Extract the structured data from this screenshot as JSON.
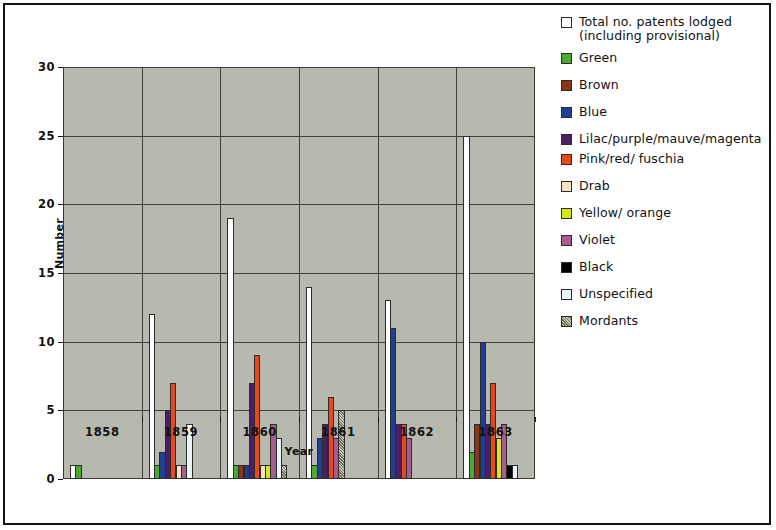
{
  "chart_data": {
    "type": "bar",
    "title": "",
    "xlabel": "Year",
    "ylabel": "Number",
    "categories": [
      "1858",
      "1859",
      "1860",
      "1861",
      "1862",
      "1863"
    ],
    "ylim": [
      0,
      30
    ],
    "yticks": [
      0,
      5,
      10,
      15,
      20,
      25,
      30
    ],
    "grid": true,
    "legend_position": "right",
    "series": [
      {
        "name": "Total no. patents lodged (including provisional)",
        "color": "#ffffff",
        "values": [
          1,
          12,
          19,
          14,
          13,
          25
        ]
      },
      {
        "name": "Green",
        "color": "#4da832",
        "values": [
          1,
          1,
          1,
          1,
          0,
          2
        ]
      },
      {
        "name": "Brown",
        "color": "#8c3415",
        "values": [
          0,
          0,
          1,
          0,
          0,
          4
        ]
      },
      {
        "name": "Blue",
        "color": "#1f3f92",
        "values": [
          0,
          2,
          1,
          3,
          11,
          10
        ]
      },
      {
        "name": "Lilac/purple/mauve/magenta",
        "color": "#4b1f63",
        "values": [
          0,
          5,
          7,
          4,
          4,
          4
        ]
      },
      {
        "name": "Pink/red/ fuschia",
        "color": "#e8491b",
        "values": [
          0,
          7,
          9,
          6,
          4,
          7
        ]
      },
      {
        "name": "Drab",
        "color": "#f7e3bd",
        "values": [
          0,
          1,
          1,
          0,
          0,
          0
        ]
      },
      {
        "name": "Yellow/ orange",
        "color": "#d6e617",
        "values": [
          0,
          0,
          1,
          0,
          0,
          3
        ]
      },
      {
        "name": "Violet",
        "color": "#a85d8e",
        "values": [
          0,
          1,
          4,
          3,
          3,
          4
        ]
      },
      {
        "name": "Black",
        "color": "#000000",
        "values": [
          0,
          0,
          0,
          0,
          0,
          1
        ]
      },
      {
        "name": "Unspecified",
        "color": "#e8f4f8",
        "values": [
          0,
          4,
          3,
          0,
          0,
          1
        ]
      },
      {
        "name": "Mordants",
        "color": "#8a8a72",
        "values": [
          0,
          0,
          1,
          5,
          0,
          0
        ]
      }
    ]
  }
}
